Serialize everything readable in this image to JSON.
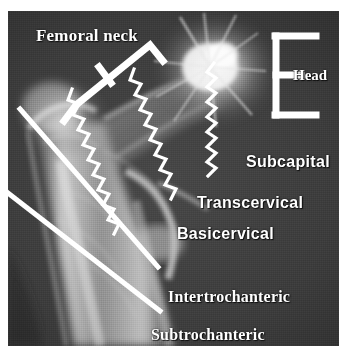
{
  "figure": {
    "kind": "annotated-radiograph",
    "background_color": "#ffffff",
    "film_color": "#3c3c3c",
    "annotation_color": "#ffffff"
  },
  "labels": {
    "femoral_neck": "Femoral neck",
    "head": "Head",
    "subcapital": "Subcapital",
    "transcervical": "Transcervical",
    "basicervical": "Basicervical",
    "intertrochanteric": "Intertrochanteric",
    "subtrochanteric": "Subtrochanteric"
  },
  "annotation_markers": {
    "femoral_neck_bracket": "rotated-span-bracket",
    "head_bracket": "vertical-span-bracket",
    "fracture_lines": [
      {
        "name": "subcapital-fracture-line",
        "style": "zigzag"
      },
      {
        "name": "transcervical-fracture-line",
        "style": "zigzag"
      },
      {
        "name": "basicervical-fracture-line",
        "style": "zigzag"
      },
      {
        "name": "intertrochanteric-fracture-line",
        "style": "straight"
      },
      {
        "name": "subtrochanteric-fracture-line",
        "style": "straight"
      }
    ]
  }
}
